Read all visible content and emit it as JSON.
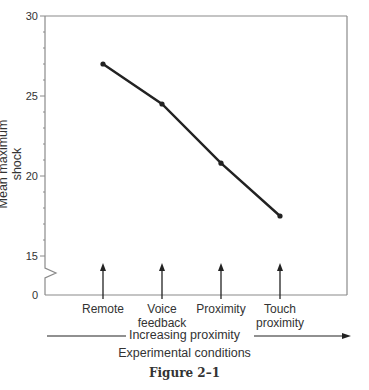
{
  "chart_data": {
    "type": "line",
    "title": "",
    "caption": "Figure 2–1",
    "xlabel": "Experimental conditions",
    "x_arrow_label": "Increasing proximity",
    "ylabel": "Mean maximum shock",
    "categories": [
      "Remote",
      "Voice feedback",
      "Proximity",
      "Touch proximity"
    ],
    "category_lines": [
      [
        "Remote"
      ],
      [
        "Voice",
        "feedback"
      ],
      [
        "Proximity"
      ],
      [
        "Touch",
        "proximity"
      ]
    ],
    "values": [
      27.0,
      24.5,
      20.8,
      17.5
    ],
    "yticks": [
      0,
      15,
      20,
      25,
      30
    ],
    "ylim": [
      15,
      30
    ],
    "axis_break": true,
    "grid": false,
    "legend": null,
    "line_color": "#222222",
    "axis_color": "#888888"
  }
}
